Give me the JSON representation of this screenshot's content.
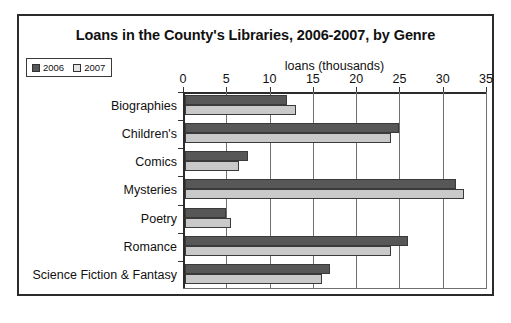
{
  "chart_data": {
    "type": "bar",
    "orientation": "horizontal",
    "title": "Loans in the County's Libraries, 2006-2007, by Genre",
    "xlabel": "loans (thousands)",
    "ylabel": "",
    "xlim": [
      0,
      35
    ],
    "xticks": [
      0,
      5,
      10,
      15,
      20,
      25,
      30,
      35
    ],
    "grid": true,
    "legend_position": "top-left",
    "categories": [
      "Biographies",
      "Children's",
      "Comics",
      "Mysteries",
      "Poetry",
      "Romance",
      "Science Fiction & Fantasy"
    ],
    "series": [
      {
        "name": "2006",
        "color": "#575757",
        "values": [
          12,
          25,
          7.5,
          31.5,
          5,
          26,
          17
        ]
      },
      {
        "name": "2007",
        "color": "#c9c9c9",
        "values": [
          13,
          24,
          6.5,
          32.5,
          5.5,
          24,
          16
        ]
      }
    ]
  }
}
